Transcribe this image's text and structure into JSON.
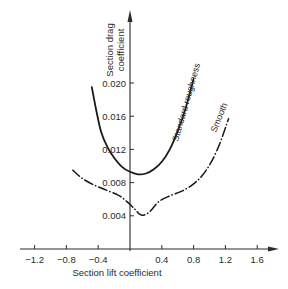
{
  "chart_data": {
    "type": "line",
    "title": "",
    "xlabel": "Section lift coefficient",
    "ylabel": "Section drag coefficient",
    "ylabel_lines": [
      "Section drag",
      "coefficient"
    ],
    "xlim": [
      -1.35,
      1.85
    ],
    "ylim": [
      0,
      0.0285
    ],
    "x_ticks": [
      -1.2,
      -0.8,
      -0.4,
      0.4,
      0.8,
      1.2,
      1.6
    ],
    "x_tick_labels": [
      "−1.2",
      "−0.8",
      "−0.4",
      "0.4",
      "0.8",
      "1.2",
      "1.6"
    ],
    "y_ticks": [
      0.004,
      0.008,
      0.012,
      0.016,
      0.02
    ],
    "y_tick_labels": [
      "0.004",
      "0.008",
      "0.012",
      "0.016",
      "0.020"
    ],
    "grid": false,
    "legend": "inline labels along curves",
    "series": [
      {
        "name": "Standard roughness",
        "style": "solid",
        "x": [
          -0.48,
          -0.42,
          -0.36,
          -0.28,
          -0.2,
          -0.1,
          0.0,
          0.1,
          0.2,
          0.3,
          0.4,
          0.5,
          0.6,
          0.7,
          0.8
        ],
        "y": [
          0.0195,
          0.0165,
          0.014,
          0.0122,
          0.011,
          0.0099,
          0.0093,
          0.009,
          0.0091,
          0.0096,
          0.0105,
          0.012,
          0.0142,
          0.017,
          0.0205
        ]
      },
      {
        "name": "Smooth",
        "style": "dash-dot",
        "x": [
          -0.72,
          -0.6,
          -0.45,
          -0.3,
          -0.15,
          -0.05,
          0.05,
          0.12,
          0.18,
          0.26,
          0.36,
          0.5,
          0.66,
          0.82,
          0.96,
          1.1,
          1.24
        ],
        "y": [
          0.0095,
          0.0085,
          0.0077,
          0.0071,
          0.0065,
          0.0058,
          0.0049,
          0.0042,
          0.0041,
          0.0046,
          0.0057,
          0.0064,
          0.007,
          0.008,
          0.0095,
          0.012,
          0.0157
        ]
      }
    ]
  }
}
